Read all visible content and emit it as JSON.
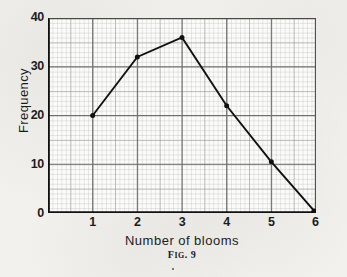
{
  "figure": {
    "caption_prefix": "F",
    "caption_small": "IG",
    "caption_suffix": ". 9",
    "caption_full": "FIG. 9"
  },
  "chart_data": {
    "type": "line",
    "title": "",
    "subtitle": "",
    "xlabel": "Number of blooms",
    "ylabel": "Frequency",
    "x": [
      1,
      2,
      3,
      4,
      5,
      6
    ],
    "values": [
      20,
      32,
      36,
      22,
      10.5,
      0
    ],
    "series": [
      {
        "name": "Frequency",
        "x": [
          1,
          2,
          3,
          4,
          5,
          6
        ],
        "values": [
          20,
          32,
          36,
          22,
          10.5,
          0
        ],
        "color": "#111111",
        "marker": "filled-diamond",
        "line_width": 1.9
      }
    ],
    "xlim": [
      0,
      6.2
    ],
    "ylim": [
      0,
      40
    ],
    "xticks": [
      1,
      2,
      3,
      4,
      5,
      6
    ],
    "xtick_labels": [
      "1",
      "2",
      "3",
      "4",
      "5",
      "6"
    ],
    "yticks": [
      0,
      10,
      20,
      30,
      40
    ],
    "ytick_labels": [
      "0",
      "10",
      "20",
      "30",
      "40"
    ],
    "grid": true,
    "grid_style": "graph-paper",
    "grid_minor_step_x": 0.1,
    "grid_minor_step_y": 1,
    "grid_major_step_x": 0.5,
    "grid_major_step_y": 5,
    "legend": false,
    "legend_position": "none",
    "annotations": [
      "FIG. 9"
    ],
    "colors": {
      "line": "#111111",
      "axis": "#111111",
      "grid_minor": "#b9b9b6",
      "grid_major": "#8d8d89",
      "plot_background": "#fbfbf9",
      "page_background": "#f2f1ee",
      "text": "#1c1c1c"
    }
  },
  "axes": {
    "y": {
      "label": "Frequency",
      "ticks": [
        {
          "value": 40,
          "label": "40"
        },
        {
          "value": 30,
          "label": "30"
        },
        {
          "value": 20,
          "label": "20"
        },
        {
          "value": 10,
          "label": "10"
        },
        {
          "value": 0,
          "label": "0"
        }
      ]
    },
    "x": {
      "label": "Number of blooms",
      "label_words": [
        "Number",
        "of",
        "blooms"
      ],
      "ticks": [
        {
          "value": 1,
          "label": "1"
        },
        {
          "value": 2,
          "label": "2"
        },
        {
          "value": 3,
          "label": "3"
        },
        {
          "value": 4,
          "label": "4"
        },
        {
          "value": 5,
          "label": "5"
        },
        {
          "value": 6,
          "label": "6"
        }
      ]
    }
  }
}
